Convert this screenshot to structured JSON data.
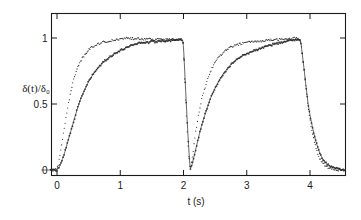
{
  "figure": {
    "kind": "scientific-plot",
    "background_color": "#ffffff",
    "ink_color": "#1a1a1a"
  },
  "chart_data": {
    "type": "scatter",
    "title": "",
    "subtitle": "",
    "xlabel": "t (s)",
    "ylabel": "δ(t)/δ₀",
    "xlabel_symbol": "t",
    "xlabel_unit": "(s)",
    "ylabel_numerator": "δ(t)",
    "ylabel_denominator": "δ₀",
    "xlim": [
      -0.28,
      4.6
    ],
    "ylim": [
      -0.12,
      1.16
    ],
    "grid": false,
    "legend": null,
    "legend_position": "none",
    "xticks": [
      0,
      1,
      2,
      3,
      4
    ],
    "xticklabels": [
      "0",
      "1",
      "2",
      "3",
      "4"
    ],
    "yticks": [
      0.5,
      1
    ],
    "yticklabels": [
      "0.5",
      "1"
    ],
    "frame": "box",
    "annotations": [],
    "series": [
      {
        "name": "fast-response-curve",
        "marker": "dot",
        "marker_size": 1.15,
        "line": "none",
        "color": "#222222",
        "x": [
          -0.25,
          -0.2,
          -0.15,
          -0.1,
          -0.05,
          0.0,
          0.02,
          0.04,
          0.06,
          0.08,
          0.1,
          0.12,
          0.14,
          0.16,
          0.18,
          0.2,
          0.22,
          0.24,
          0.26,
          0.28,
          0.3,
          0.33,
          0.36,
          0.39,
          0.42,
          0.45,
          0.48,
          0.52,
          0.56,
          0.6,
          0.65,
          0.7,
          0.75,
          0.8,
          0.85,
          0.9,
          0.95,
          1.0,
          1.05,
          1.1,
          1.15,
          1.2,
          1.25,
          1.3,
          1.35,
          1.4,
          1.45,
          1.5,
          1.55,
          1.6,
          1.65,
          1.7,
          1.75,
          1.8,
          1.85,
          1.9,
          1.95,
          1.97,
          1.99,
          2.0,
          2.01,
          2.02,
          2.03,
          2.04,
          2.05,
          2.06,
          2.07,
          2.08,
          2.09,
          2.1,
          2.12,
          2.14,
          2.16,
          2.18,
          2.2,
          2.22,
          2.25,
          2.28,
          2.31,
          2.35,
          2.39,
          2.43,
          2.47,
          2.52,
          2.57,
          2.62,
          2.67,
          2.73,
          2.79,
          2.85,
          2.92,
          2.99,
          3.06,
          3.13,
          3.2,
          3.27,
          3.34,
          3.41,
          3.48,
          3.55,
          3.62,
          3.69,
          3.76,
          3.82,
          3.85,
          3.87,
          3.9,
          3.93,
          3.96,
          4.0,
          4.04,
          4.08,
          4.12,
          4.16,
          4.2,
          4.25,
          4.3,
          4.35,
          4.4,
          4.45,
          4.5,
          4.55
        ],
        "y": [
          0.0,
          0.0,
          0.0,
          0.0,
          0.0,
          0.01,
          0.04,
          0.09,
          0.15,
          0.21,
          0.27,
          0.33,
          0.39,
          0.45,
          0.5,
          0.55,
          0.6,
          0.64,
          0.68,
          0.71,
          0.74,
          0.78,
          0.81,
          0.84,
          0.86,
          0.88,
          0.9,
          0.92,
          0.935,
          0.945,
          0.955,
          0.965,
          0.97,
          0.975,
          0.98,
          0.985,
          0.985,
          0.99,
          0.995,
          1.0,
          1.0,
          0.995,
          1.0,
          0.995,
          0.99,
          0.995,
          1.0,
          0.99,
          0.985,
          0.99,
          0.995,
          0.985,
          0.99,
          0.995,
          0.99,
          0.99,
          0.985,
          0.98,
          0.97,
          0.9,
          0.78,
          0.66,
          0.55,
          0.45,
          0.36,
          0.28,
          0.2,
          0.13,
          0.07,
          0.02,
          0.04,
          0.1,
          0.17,
          0.24,
          0.31,
          0.37,
          0.45,
          0.52,
          0.58,
          0.64,
          0.7,
          0.75,
          0.79,
          0.83,
          0.86,
          0.885,
          0.905,
          0.925,
          0.94,
          0.95,
          0.96,
          0.965,
          0.97,
          0.975,
          0.975,
          0.98,
          0.985,
          0.985,
          0.99,
          0.99,
          0.995,
          0.995,
          1.0,
          0.995,
          0.98,
          0.93,
          0.8,
          0.66,
          0.52,
          0.38,
          0.27,
          0.19,
          0.13,
          0.08,
          0.05,
          0.03,
          0.015,
          0.01,
          0.005,
          0.0,
          0.0,
          0.0
        ]
      },
      {
        "name": "slow-response-curve",
        "marker": "square",
        "marker_size": 1.5,
        "line": "solid",
        "color": "#333333",
        "x": [
          -0.25,
          -0.2,
          -0.15,
          -0.1,
          -0.05,
          0.0,
          0.03,
          0.06,
          0.09,
          0.12,
          0.15,
          0.18,
          0.21,
          0.24,
          0.27,
          0.3,
          0.34,
          0.38,
          0.42,
          0.46,
          0.5,
          0.55,
          0.6,
          0.65,
          0.7,
          0.75,
          0.8,
          0.85,
          0.9,
          0.95,
          1.0,
          1.05,
          1.1,
          1.15,
          1.2,
          1.25,
          1.3,
          1.35,
          1.4,
          1.45,
          1.5,
          1.55,
          1.6,
          1.65,
          1.7,
          1.75,
          1.8,
          1.85,
          1.9,
          1.94,
          1.97,
          1.99,
          2.0,
          2.01,
          2.02,
          2.03,
          2.04,
          2.05,
          2.06,
          2.07,
          2.08,
          2.09,
          2.1,
          2.11,
          2.13,
          2.15,
          2.17,
          2.2,
          2.23,
          2.26,
          2.3,
          2.34,
          2.38,
          2.42,
          2.47,
          2.52,
          2.57,
          2.63,
          2.69,
          2.75,
          2.81,
          2.88,
          2.95,
          3.02,
          3.09,
          3.16,
          3.23,
          3.3,
          3.37,
          3.44,
          3.51,
          3.58,
          3.65,
          3.72,
          3.79,
          3.84,
          3.86,
          3.88,
          3.91,
          3.94,
          3.97,
          4.01,
          4.05,
          4.09,
          4.13,
          4.17,
          4.22,
          4.27,
          4.32,
          4.38,
          4.44,
          4.5,
          4.56
        ],
        "y": [
          0.0,
          0.0,
          0.0,
          0.0,
          0.0,
          0.0,
          0.02,
          0.05,
          0.09,
          0.13,
          0.18,
          0.23,
          0.28,
          0.33,
          0.38,
          0.43,
          0.49,
          0.545,
          0.59,
          0.63,
          0.67,
          0.71,
          0.745,
          0.775,
          0.8,
          0.825,
          0.845,
          0.862,
          0.878,
          0.892,
          0.905,
          0.916,
          0.93,
          0.94,
          0.95,
          0.955,
          0.965,
          0.96,
          0.97,
          0.965,
          0.975,
          0.97,
          0.975,
          0.98,
          0.975,
          0.985,
          0.98,
          0.985,
          0.99,
          0.99,
          0.985,
          0.98,
          0.93,
          0.84,
          0.74,
          0.64,
          0.545,
          0.45,
          0.36,
          0.27,
          0.19,
          0.11,
          0.04,
          0.01,
          0.03,
          0.07,
          0.11,
          0.17,
          0.23,
          0.29,
          0.36,
          0.42,
          0.48,
          0.535,
          0.59,
          0.64,
          0.685,
          0.73,
          0.765,
          0.8,
          0.825,
          0.85,
          0.87,
          0.885,
          0.9,
          0.912,
          0.925,
          0.935,
          0.945,
          0.955,
          0.962,
          0.97,
          0.975,
          0.985,
          0.99,
          0.985,
          0.95,
          0.87,
          0.75,
          0.62,
          0.5,
          0.39,
          0.3,
          0.22,
          0.16,
          0.11,
          0.07,
          0.045,
          0.028,
          0.015,
          0.008,
          0.003,
          0.0
        ]
      }
    ]
  }
}
